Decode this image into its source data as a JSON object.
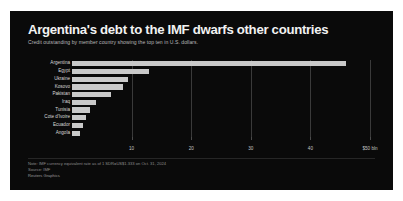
{
  "header": {
    "title": "Argentina's debt to the IMF dwarfs other countries",
    "subtitle": "Credit outstanding by member country showing the top ten in U.S. dollars."
  },
  "footer": {
    "note": "Note: IMF currency equivalent rate as of 1 SDR=US$1.333 on Oct. 31, 2024",
    "source": "Source: IMF",
    "credit": "Reuters Graphics"
  },
  "chart_data": {
    "type": "bar",
    "orientation": "horizontal",
    "title": "Argentina's debt to the IMF dwarfs other countries",
    "subtitle": "Credit outstanding by member country showing the top ten in U.S. dollars.",
    "xlabel": "",
    "ylabel": "",
    "xlim": [
      0,
      51
    ],
    "grid": true,
    "legend": false,
    "bar_color": "#c9c9c9",
    "background_color": "#0a0a0a",
    "categories": [
      "Argentina",
      "Egypt",
      "Ukraine",
      "Kosovo",
      "Pakistan",
      "Iraq",
      "Tunisia",
      "Cote d'Ivoire",
      "Ecuador",
      "Angola"
    ],
    "values": [
      46.0,
      13.0,
      9.4,
      8.6,
      6.6,
      4.1,
      3.1,
      2.4,
      1.9,
      1.4
    ],
    "tick_values": [
      10,
      20,
      30,
      40,
      50
    ],
    "tick_labels": [
      "10",
      "20",
      "30",
      "40",
      "$50 bln"
    ]
  }
}
